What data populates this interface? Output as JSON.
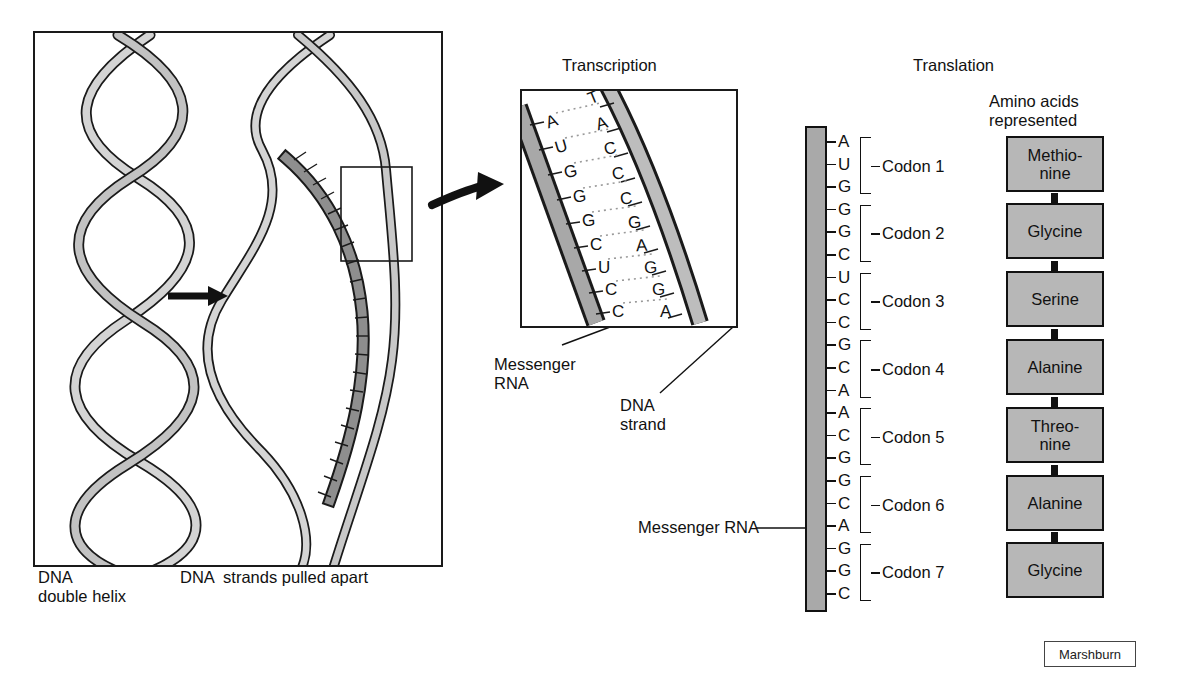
{
  "figure": {
    "attribution": "Marshburn"
  },
  "panels": {
    "dna": {
      "label_left_line1": "DNA",
      "label_left_line2": "double helix",
      "label_right": "DNA  strands pulled apart"
    },
    "transcription": {
      "title": "Transcription",
      "mrna_label_line1": "Messenger",
      "mrna_label_line2": "RNA",
      "dna_label_line1": "DNA",
      "dna_label_line2": "strand",
      "mrna_bases": [
        "A",
        "U",
        "G",
        "G",
        "G",
        "C",
        "U",
        "C",
        "C"
      ],
      "dna_bases": [
        "T",
        "A",
        "C",
        "C",
        "C",
        "G",
        "A",
        "G",
        "G",
        "A"
      ]
    },
    "translation": {
      "title": "Translation",
      "amino_heading_line1": "Amino acids",
      "amino_heading_line2": "represented",
      "mrna_label": "Messenger RNA",
      "mrna_sequence": [
        "A",
        "U",
        "G",
        "G",
        "G",
        "C",
        "U",
        "C",
        "C",
        "G",
        "C",
        "A",
        "A",
        "C",
        "G",
        "G",
        "C",
        "A",
        "G",
        "G",
        "C"
      ],
      "codons": [
        {
          "name": "Codon 1",
          "bases": [
            "A",
            "U",
            "G"
          ],
          "amino_acid": "Methio-\nnine"
        },
        {
          "name": "Codon 2",
          "bases": [
            "G",
            "G",
            "C"
          ],
          "amino_acid": "Glycine"
        },
        {
          "name": "Codon 3",
          "bases": [
            "U",
            "C",
            "C"
          ],
          "amino_acid": "Serine"
        },
        {
          "name": "Codon 4",
          "bases": [
            "G",
            "C",
            "A"
          ],
          "amino_acid": "Alanine"
        },
        {
          "name": "Codon 5",
          "bases": [
            "A",
            "C",
            "G"
          ],
          "amino_acid": "Threo-\nnine"
        },
        {
          "name": "Codon 6",
          "bases": [
            "G",
            "C",
            "A"
          ],
          "amino_acid": "Alanine"
        },
        {
          "name": "Codon 7",
          "bases": [
            "G",
            "G",
            "C"
          ],
          "amino_acid": "Glycine"
        }
      ]
    }
  },
  "colors": {
    "ribbon_light": "#d2d2d2",
    "ribbon_dark": "#8f8f8f",
    "mrna_strip": "#a9a9a9",
    "amino_box": "#b7b7b7",
    "outline": "#1a1a1a"
  }
}
